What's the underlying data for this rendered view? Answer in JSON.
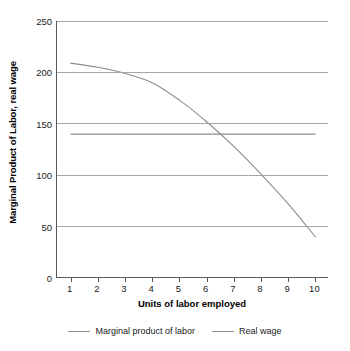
{
  "chart_data": {
    "type": "line",
    "title": "",
    "xlabel": "Units of labor employed",
    "ylabel": "Marginal Product of Labor, real wage",
    "x": [
      1,
      2,
      3,
      4,
      5,
      6,
      7,
      8,
      9,
      10
    ],
    "xlim": [
      0.5,
      10.5
    ],
    "ylim": [
      0,
      250
    ],
    "ytick_labels": [
      "0",
      "50",
      "100",
      "150",
      "200",
      "250"
    ],
    "ytick_values": [
      0,
      50,
      100,
      150,
      200,
      250
    ],
    "xtick_labels": [
      "1",
      "2",
      "3",
      "4",
      "5",
      "6",
      "7",
      "8",
      "9",
      "10"
    ],
    "grid": "horizontal",
    "legend_position": "bottom-center",
    "series": [
      {
        "name": "Marginal product of labor",
        "values": [
          209,
          205,
          199,
          190,
          173,
          152,
          128,
          101,
          72,
          40
        ],
        "color": "#8c8c8c"
      },
      {
        "name": "Real wage",
        "values": [
          140,
          140,
          140,
          140,
          140,
          140,
          140,
          140,
          140,
          140
        ],
        "color": "#8c8c8c"
      }
    ],
    "colors": {
      "line": "#8c8c8c",
      "gridline": "#a6a6a6",
      "axis": "#595959",
      "text": "#1a1a1a",
      "background": "#ffffff"
    }
  },
  "axes": {
    "y_title": "Marginal Product of Labor, real wage",
    "x_title": "Units of labor employed",
    "y_ticks": [
      {
        "label": "250",
        "value": 250
      },
      {
        "label": "200",
        "value": 200
      },
      {
        "label": "150",
        "value": 150
      },
      {
        "label": "100",
        "value": 100
      },
      {
        "label": "50",
        "value": 50
      },
      {
        "label": "0",
        "value": 0
      }
    ],
    "x_ticks": [
      {
        "label": "1",
        "value": 1
      },
      {
        "label": "2",
        "value": 2
      },
      {
        "label": "3",
        "value": 3
      },
      {
        "label": "4",
        "value": 4
      },
      {
        "label": "5",
        "value": 5
      },
      {
        "label": "6",
        "value": 6
      },
      {
        "label": "7",
        "value": 7
      },
      {
        "label": "8",
        "value": 8
      },
      {
        "label": "9",
        "value": 9
      },
      {
        "label": "10",
        "value": 10
      }
    ]
  },
  "legend": {
    "items": [
      {
        "label": "Marginal product of labor"
      },
      {
        "label": "Real wage"
      }
    ]
  }
}
